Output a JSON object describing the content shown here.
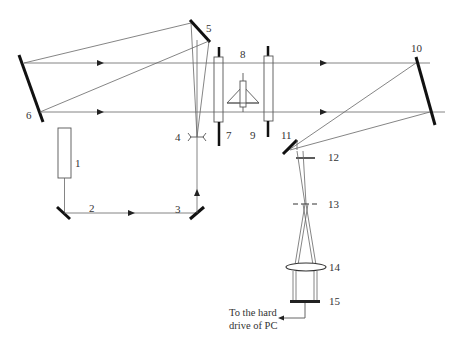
{
  "diagram": {
    "type": "optical-setup-schematic",
    "labels": {
      "l1": "1",
      "l2": "2",
      "l3": "3",
      "l4": "4",
      "l5": "5",
      "l6": "6",
      "l7": "7",
      "l8": "8",
      "l9": "9",
      "l10": "10",
      "l11": "11",
      "l12": "12",
      "l13": "13",
      "l14": "14",
      "l15": "15"
    },
    "caption_line1": "To the hard",
    "caption_line2": "drive of PC",
    "colors": {
      "ray": "#666666",
      "mirror": "#111111",
      "background": "#ffffff"
    }
  }
}
